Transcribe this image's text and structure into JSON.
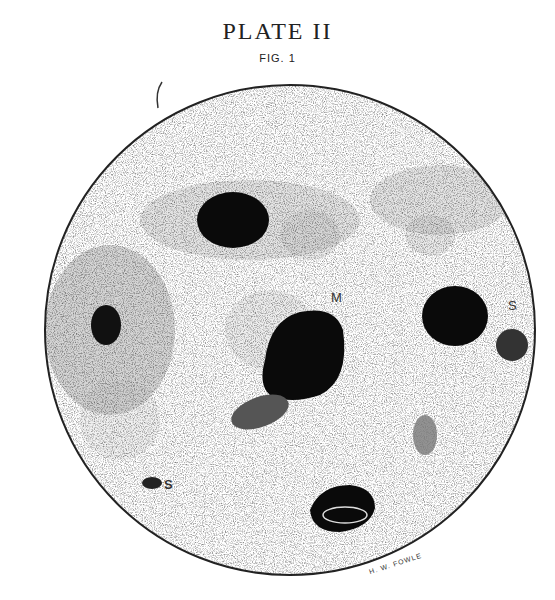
{
  "plate": {
    "title": "PLATE II",
    "figure": "FIG. 1",
    "labels": {
      "m": "M",
      "s_right": "S",
      "s_left": "S"
    },
    "signature": "H. W. FOWLE"
  }
}
